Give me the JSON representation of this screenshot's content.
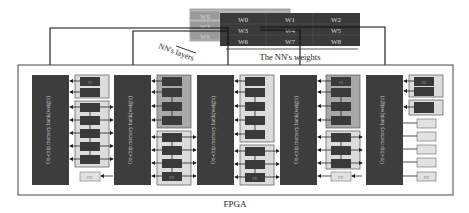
{
  "weights": {
    "title": "The NN's weights",
    "layers_label": "NN's layers",
    "grid": [
      [
        "W0",
        "W1",
        "W2"
      ],
      [
        "W3",
        "W4",
        "W5"
      ],
      [
        "W6",
        "W7",
        "W8"
      ]
    ],
    "back_layer_labels": [
      "W'0",
      "W'3",
      "W'6"
    ],
    "colors": {
      "front": "#3a3a3a",
      "back": "#9a9a9a",
      "text_front": "#d8d8d8",
      "text_back": "#d0d0d0"
    }
  },
  "fpga": {
    "label": "FPGA",
    "banks": [
      {
        "label": "On-chip memory bank(weight)"
      },
      {
        "label": "On-chip memory bank(weight)"
      },
      {
        "label": "On-chip memory bank(weight)"
      },
      {
        "label": "On-chip memory bank(weight)"
      },
      {
        "label": "On-chip memory bank(weight)"
      }
    ],
    "pe_label": "PE",
    "colors": {
      "bank": "#3d3d3d",
      "pe_active": "#3a3a3a",
      "pe_idle": "#e2e2e2",
      "group_fill": "#dcdcdc",
      "group_fill_dark": "#a8a8a8",
      "border": "#555555"
    }
  }
}
